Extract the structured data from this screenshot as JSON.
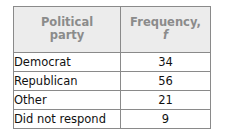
{
  "table": {
    "columns": [
      {
        "key": "party",
        "header_line1": "Political",
        "header_line2": "party"
      },
      {
        "key": "frequency",
        "header_line1": "Frequency,",
        "header_line2": "f"
      }
    ],
    "rows": [
      {
        "party": "Democrat",
        "frequency": "34"
      },
      {
        "party": "Republican",
        "frequency": "56"
      },
      {
        "party": "Other",
        "frequency": "21"
      },
      {
        "party": "Did not respond",
        "frequency": "9"
      }
    ]
  },
  "chart_data": {
    "type": "table",
    "title": "",
    "categories": [
      "Democrat",
      "Republican",
      "Other",
      "Did not respond"
    ],
    "values": [
      34,
      56,
      21,
      9
    ],
    "xlabel": "Political party",
    "ylabel": "Frequency, f",
    "columns": [
      "Political party",
      "Frequency, f"
    ]
  },
  "colors": {
    "header_background": "#ececec",
    "header_text": "#8b8b8b",
    "body_text": "#111111",
    "border": "#8a8a8a",
    "page_background": "#ffffff"
  }
}
